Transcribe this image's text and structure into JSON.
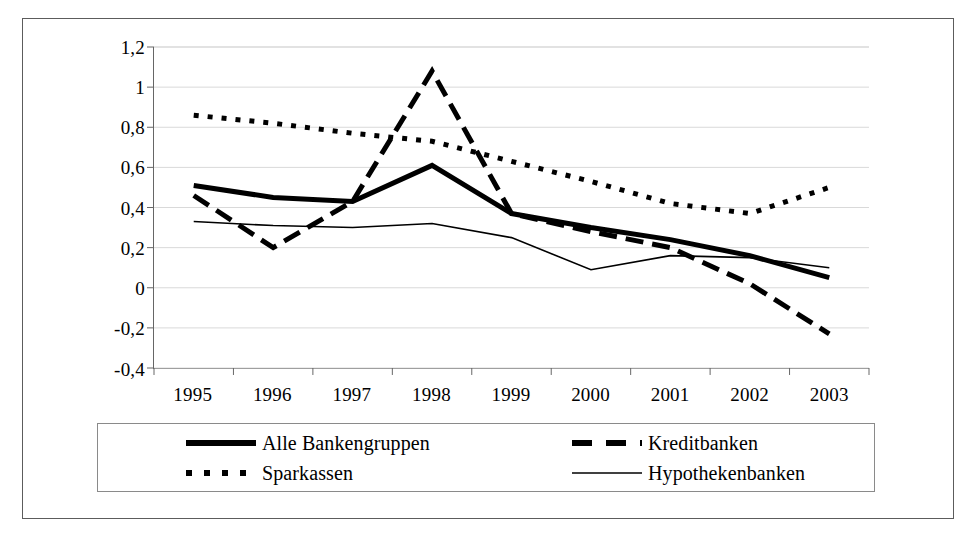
{
  "chart_data": {
    "type": "line",
    "title": "",
    "subtitle": "",
    "xlabel": "",
    "ylabel": "",
    "categories": [
      "1995",
      "1996",
      "1997",
      "1998",
      "1999",
      "2000",
      "2001",
      "2002",
      "2003"
    ],
    "ylim": [
      -0.4,
      1.2
    ],
    "yticks": [
      1.2,
      1.0,
      0.8,
      0.6,
      0.4,
      0.2,
      0.0,
      -0.2,
      -0.4
    ],
    "ytick_labels": [
      "1,2",
      "1",
      "0,8",
      "0,6",
      "0,4",
      "0,2",
      "0",
      "-0,2",
      "-0,4"
    ],
    "grid": "horizontal",
    "legend_position": "bottom",
    "decimal_separator": ",",
    "series": [
      {
        "name": "Alle Bankengruppen",
        "style": "solid-thick",
        "color": "#000000",
        "width": 5,
        "dash": "",
        "values": [
          0.51,
          0.45,
          0.43,
          0.61,
          0.37,
          0.3,
          0.24,
          0.16,
          0.05
        ]
      },
      {
        "name": "Kreditbanken",
        "style": "long-dash",
        "color": "#000000",
        "width": 5,
        "dash": "18,9",
        "values": [
          0.46,
          0.2,
          0.43,
          1.08,
          0.37,
          0.28,
          0.2,
          0.02,
          -0.23
        ]
      },
      {
        "name": "Sparkassen",
        "style": "dotted",
        "color": "#000000",
        "width": 5,
        "dash": "5,9",
        "values": [
          0.86,
          0.82,
          0.77,
          0.73,
          0.63,
          0.53,
          0.42,
          0.37,
          0.5
        ]
      },
      {
        "name": "Hypothekenbanken",
        "style": "solid-thin",
        "color": "#000000",
        "width": 1.6,
        "dash": "",
        "values": [
          0.33,
          0.31,
          0.3,
          0.32,
          0.25,
          0.09,
          0.16,
          0.15,
          0.1
        ]
      }
    ]
  },
  "legend": {
    "items": [
      {
        "label": "Alle Bankengruppen",
        "series_index": 0
      },
      {
        "label": "Kreditbanken",
        "series_index": 1
      },
      {
        "label": "Sparkassen",
        "series_index": 2
      },
      {
        "label": "Hypothekenbanken",
        "series_index": 3
      }
    ]
  },
  "colors": {
    "background": "#ffffff",
    "frame": "#5c5c5c",
    "axis": "#666666",
    "gridline": "#d9d9d9",
    "ink": "#000000"
  }
}
